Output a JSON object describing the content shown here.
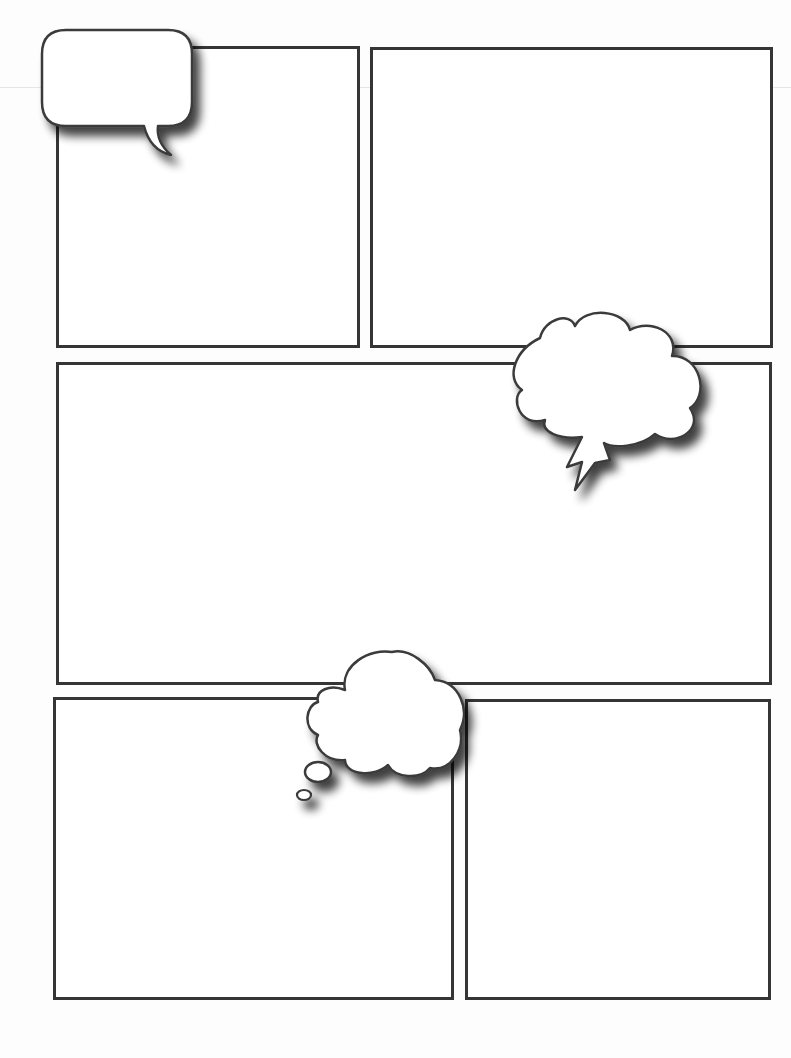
{
  "page": {
    "type": "comic-strip-template",
    "background": "#fdfdfd",
    "border_color": "#353535"
  },
  "panels": [
    {
      "id": "panel-1",
      "row": 1,
      "position": "top-left",
      "x": 56,
      "y": 46,
      "w": 304,
      "h": 302
    },
    {
      "id": "panel-2",
      "row": 1,
      "position": "top-right",
      "x": 370,
      "y": 47,
      "w": 403,
      "h": 301
    },
    {
      "id": "panel-3",
      "row": 2,
      "position": "middle-wide",
      "x": 56,
      "y": 362,
      "w": 716,
      "h": 323
    },
    {
      "id": "panel-4",
      "row": 3,
      "position": "bottom-left",
      "x": 53,
      "y": 697,
      "w": 401,
      "h": 303
    },
    {
      "id": "panel-5",
      "row": 3,
      "position": "bottom-right",
      "x": 465,
      "y": 699,
      "w": 306,
      "h": 301
    }
  ],
  "balloons": [
    {
      "id": "speech-balloon",
      "kind": "speech",
      "shape": "rounded-rectangle",
      "tail": "curved",
      "text": ""
    },
    {
      "id": "shout-balloon",
      "kind": "exclamation",
      "shape": "cloud",
      "tail": "lightning-bolt",
      "text": ""
    },
    {
      "id": "thought-balloon",
      "kind": "thought",
      "shape": "cloud",
      "tail": "bubbles",
      "text": ""
    }
  ]
}
